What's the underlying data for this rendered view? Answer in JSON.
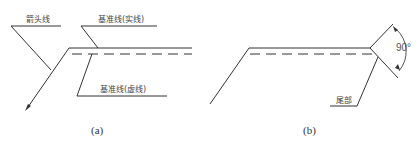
{
  "figure_a": {
    "caption": "(a)",
    "labels": {
      "arrow_line": "箭头线",
      "reference_solid": "基准线(实线)",
      "reference_dashed": "基准线(虚线)"
    }
  },
  "figure_b": {
    "caption": "(b)",
    "labels": {
      "angle": "90°",
      "tail": "尾部"
    }
  },
  "colors": {
    "line": "#333333",
    "text": "#444444",
    "background": "#ffffff"
  }
}
